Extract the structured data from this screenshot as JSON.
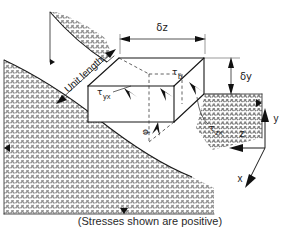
{
  "figure": {
    "title_caption": "(Stresses shown are positive)",
    "dimensions": {
      "width_label": "δz",
      "height_label": "δy",
      "depth_label": "Unit length"
    },
    "stress_labels": {
      "tau_symbol": "τ",
      "tau_b_sub": "b",
      "tau_yx_sub": "yx",
      "tau_zx_sub": "zx",
      "angle_label": "φ"
    },
    "axes": {
      "y_label": "y",
      "z_label": "z",
      "x_label": "x"
    },
    "colors": {
      "line": "#161616",
      "hatch": "#8a8a8a",
      "arrow": "#111111",
      "background": "#ffffff",
      "caption": "#2a2a2a"
    }
  }
}
